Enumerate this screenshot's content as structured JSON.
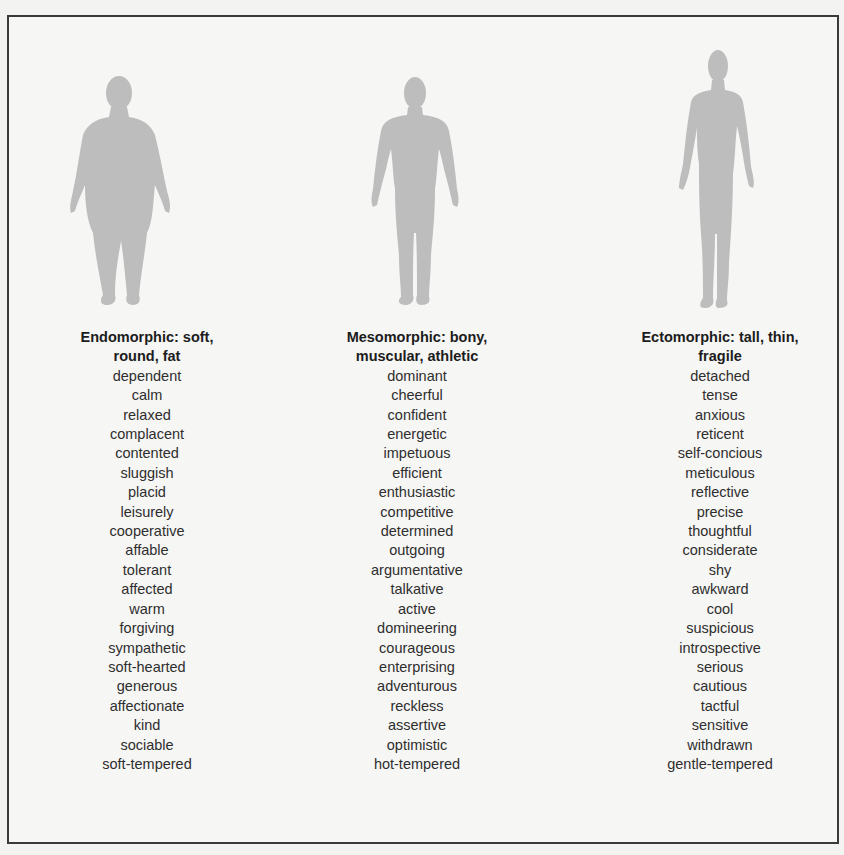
{
  "figure": {
    "border_color": "#3a3a3a",
    "silhouette_color": "#bdbdbd",
    "background_color": "#f6f6f5"
  },
  "columns": [
    {
      "type": "endomorphic",
      "header_line1": "Endomorphic:  soft,",
      "header_line2": "round, fat",
      "silhouette": "endomorph-silhouette",
      "traits": [
        "dependent",
        "calm",
        "relaxed",
        "complacent",
        "contented",
        "sluggish",
        "placid",
        "leisurely",
        "cooperative",
        "affable",
        "tolerant",
        "affected",
        "warm",
        "forgiving",
        "sympathetic",
        "soft-hearted",
        "generous",
        "affectionate",
        "kind",
        "sociable",
        "soft-tempered"
      ]
    },
    {
      "type": "mesomorphic",
      "header_line1": "Mesomorphic:  bony,",
      "header_line2": "muscular, athletic",
      "silhouette": "mesomorph-silhouette",
      "traits": [
        "dominant",
        "cheerful",
        "confident",
        "energetic",
        "impetuous",
        "efficient",
        "enthusiastic",
        "competitive",
        "determined",
        "outgoing",
        "argumentative",
        "talkative",
        "active",
        "domineering",
        "courageous",
        "enterprising",
        "adventurous",
        "reckless",
        "assertive",
        "optimistic",
        "hot-tempered"
      ]
    },
    {
      "type": "ectomorphic",
      "header_line1": "Ectomorphic:  tall, thin,",
      "header_line2": "fragile",
      "silhouette": "ectomorph-silhouette",
      "traits": [
        "detached",
        "tense",
        "anxious",
        "reticent",
        "self-concious",
        "meticulous",
        "reflective",
        "precise",
        "thoughtful",
        "considerate",
        "shy",
        "awkward",
        "cool",
        "suspicious",
        "introspective",
        "serious",
        "cautious",
        "tactful",
        "sensitive",
        "withdrawn",
        "gentle-tempered"
      ]
    }
  ]
}
